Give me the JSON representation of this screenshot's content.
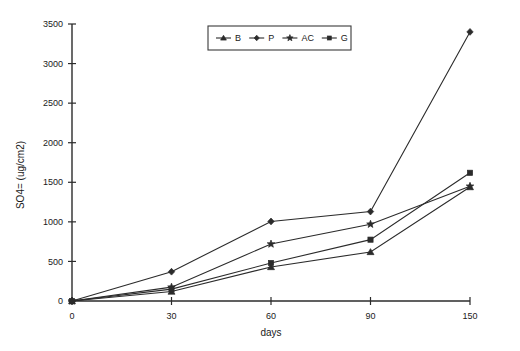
{
  "chart_data": {
    "type": "line",
    "title": "",
    "xlabel": "days",
    "ylabel": "SO4= (ug/cm2)",
    "x": [
      0,
      30,
      60,
      90,
      150
    ],
    "xtick_labels": [
      "0",
      "30",
      "60",
      "90",
      "150"
    ],
    "ytick_labels": [
      "0",
      "500",
      "1000",
      "1500",
      "2000",
      "2500",
      "3000",
      "3500"
    ],
    "yticks": [
      0,
      500,
      1000,
      1500,
      2000,
      2500,
      3000,
      3500
    ],
    "ylim": [
      0,
      3500
    ],
    "xlim": [
      0,
      150
    ],
    "grid": false,
    "legend_position": "top-center",
    "x_axis_scale": "categorical-even-spacing",
    "series": [
      {
        "name": "B",
        "marker": "triangle",
        "values": [
          0,
          120,
          430,
          620,
          1440
        ]
      },
      {
        "name": "P",
        "marker": "diamond",
        "values": [
          0,
          370,
          1005,
          1130,
          3400
        ]
      },
      {
        "name": "AC",
        "marker": "star",
        "values": [
          0,
          175,
          720,
          970,
          1450
        ]
      },
      {
        "name": "G",
        "marker": "square",
        "values": [
          0,
          150,
          480,
          775,
          1620
        ]
      }
    ]
  },
  "legend": {
    "entries": [
      {
        "label": "B",
        "marker_name": "triangle-marker-icon"
      },
      {
        "label": "P",
        "marker_name": "diamond-marker-icon"
      },
      {
        "label": "AC",
        "marker_name": "star-marker-icon"
      },
      {
        "label": "G",
        "marker_name": "square-marker-icon"
      }
    ]
  },
  "colors": {
    "line": "#2b2b2b",
    "axis": "#2b2b2b",
    "text": "#1a1a1a",
    "background": "#ffffff"
  }
}
